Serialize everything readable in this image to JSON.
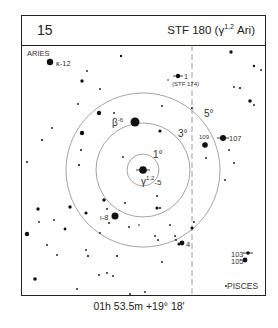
{
  "header": {
    "number": "15",
    "title_prefix": "STF 180 (γ",
    "title_sup": "1,2",
    "title_suffix": " Ari)"
  },
  "chart": {
    "center": [
      143,
      170
    ],
    "rings": [
      {
        "radius": 16,
        "label": "1°",
        "label_pos": [
          153,
          158
        ]
      },
      {
        "radius": 47,
        "label": "3°",
        "label_pos": [
          178,
          137
        ]
      },
      {
        "radius": 77,
        "label": "5°",
        "label_pos": [
          204,
          117
        ]
      }
    ],
    "ring_color": "#999999",
    "dashed_line_x": 192,
    "constellations": [
      {
        "name": "ARIES",
        "pos": [
          27,
          56
        ]
      },
      {
        "name": "PISCES",
        "pos": [
          227,
          289
        ]
      }
    ],
    "labeled_stars": [
      {
        "label": "κ-12",
        "pos": [
          50,
          62
        ],
        "r": 3.2,
        "label_pos": [
          56,
          66
        ]
      },
      {
        "label": "1",
        "pos": [
          178,
          76
        ],
        "r": 2.2,
        "label_pos": [
          184,
          79
        ],
        "double": true
      },
      {
        "label": "(STF 174)",
        "pos": [
          null,
          null
        ],
        "label_pos": [
          172,
          86
        ],
        "small": true
      },
      {
        "label": "β-6",
        "pos": [
          135,
          122
        ],
        "r": 4.5,
        "label_pos": [
          112,
          126
        ]
      },
      {
        "label": "109",
        "pos": [
          205,
          145
        ],
        "r": 2.8,
        "label_pos": [
          199,
          139
        ],
        "small": true
      },
      {
        "label": "107",
        "pos": [
          223,
          138
        ],
        "r": 3.0,
        "label_pos": [
          229,
          141
        ]
      },
      {
        "label": "γ1,2-5",
        "pos": [
          143,
          170
        ],
        "r": 3.8,
        "label_pos": [
          141,
          185
        ]
      },
      {
        "label": "ι-8",
        "pos": [
          115,
          216
        ],
        "r": 3.5,
        "label_pos": [
          100,
          220
        ]
      },
      {
        "label": "4",
        "pos": [
          182,
          243
        ],
        "r": 2.4,
        "label_pos": [
          186,
          247
        ]
      },
      {
        "label": "103",
        "pos": [
          248,
          253
        ],
        "r": 1.8,
        "label_pos": [
          231,
          257
        ]
      },
      {
        "label": "105",
        "pos": [
          245,
          260
        ],
        "r": 2.4,
        "label_pos": [
          231,
          264
        ]
      }
    ],
    "unlabeled_stars": [
      [
        87,
        71,
        0.9
      ],
      [
        121,
        56,
        1.2
      ],
      [
        231,
        52,
        1.7
      ],
      [
        254,
        66,
        1.2
      ],
      [
        261,
        70,
        0.9
      ],
      [
        82,
        81,
        1.7
      ],
      [
        100,
        89,
        0.9
      ],
      [
        78,
        104,
        0.9
      ],
      [
        162,
        106,
        0.9
      ],
      [
        168,
        80,
        0.8
      ],
      [
        234,
        87,
        0.9
      ],
      [
        240,
        88,
        1.1
      ],
      [
        250,
        101,
        1.8
      ],
      [
        254,
        105,
        0.9
      ],
      [
        99,
        113,
        2.2
      ],
      [
        82,
        133,
        2.2
      ],
      [
        114,
        113,
        0.9
      ],
      [
        52,
        128,
        0.9
      ],
      [
        42,
        140,
        1.1
      ],
      [
        160,
        131,
        1.6
      ],
      [
        192,
        108,
        0.9
      ],
      [
        206,
        158,
        0.9
      ],
      [
        229,
        150,
        0.9
      ],
      [
        234,
        163,
        0.9
      ],
      [
        123,
        157,
        0.9
      ],
      [
        79,
        165,
        1.1
      ],
      [
        70,
        207,
        1.7
      ],
      [
        38,
        209,
        1.7
      ],
      [
        104,
        200,
        1.7
      ],
      [
        107,
        209,
        0.9
      ],
      [
        86,
        213,
        1.6
      ],
      [
        125,
        203,
        0.9
      ],
      [
        157,
        196,
        0.9
      ],
      [
        157,
        208,
        1.6
      ],
      [
        160,
        208,
        1.0
      ],
      [
        39,
        222,
        0.9
      ],
      [
        54,
        220,
        0.9
      ],
      [
        27,
        234,
        2.2
      ],
      [
        109,
        223,
        0.9
      ],
      [
        129,
        227,
        0.9
      ],
      [
        139,
        225,
        0.8
      ],
      [
        47,
        245,
        0.9
      ],
      [
        100,
        233,
        0.9
      ],
      [
        155,
        236,
        0.9
      ],
      [
        170,
        225,
        0.9
      ],
      [
        175,
        236,
        0.9
      ],
      [
        192,
        228,
        1.6
      ],
      [
        65,
        229,
        1.4
      ],
      [
        86,
        250,
        0.9
      ],
      [
        158,
        240,
        0.9
      ],
      [
        179,
        244,
        1.6
      ],
      [
        194,
        222,
        0.9
      ],
      [
        57,
        255,
        0.9
      ],
      [
        88,
        256,
        1.1
      ],
      [
        117,
        256,
        1.1
      ],
      [
        107,
        273,
        0.9
      ],
      [
        113,
        276,
        0.9
      ],
      [
        35,
        279,
        1.8
      ],
      [
        99,
        275,
        0.9
      ],
      [
        77,
        289,
        0.9
      ],
      [
        130,
        294,
        0.9
      ],
      [
        145,
        292,
        0.9
      ],
      [
        176,
        240,
        0.9
      ],
      [
        162,
        262,
        0.9
      ],
      [
        226,
        286,
        0.9
      ],
      [
        27,
        162,
        1.0
      ],
      [
        81,
        150,
        1.0
      ],
      [
        225,
        180,
        0.9
      ]
    ]
  },
  "footer": {
    "coordinates": "01h 53.5m  +19° 18′"
  }
}
